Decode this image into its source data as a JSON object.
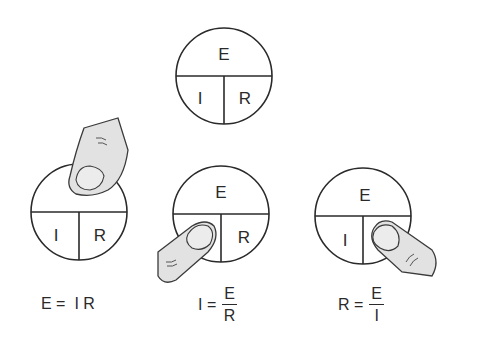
{
  "diagrams": {
    "main": {
      "top": "E",
      "bottom_left": "I",
      "bottom_right": "R"
    },
    "solve_e": {
      "top": "",
      "bottom_left": "I",
      "bottom_right": "R",
      "covered": "E"
    },
    "solve_i": {
      "top": "E",
      "bottom_left": "",
      "bottom_right": "R",
      "covered": "I"
    },
    "solve_r": {
      "top": "E",
      "bottom_left": "I",
      "bottom_right": "",
      "covered": "R"
    }
  },
  "formulas": {
    "e": {
      "lhs": "E =",
      "rhs": "I R"
    },
    "i": {
      "lhs": "I =",
      "numerator": "E",
      "denominator": "R"
    },
    "r": {
      "lhs": "R =",
      "numerator": "E",
      "denominator": "I"
    }
  },
  "colors": {
    "line": "#2a2a2a",
    "finger_fill": "#e2e2e2",
    "finger_stroke": "#3a3a3a"
  }
}
